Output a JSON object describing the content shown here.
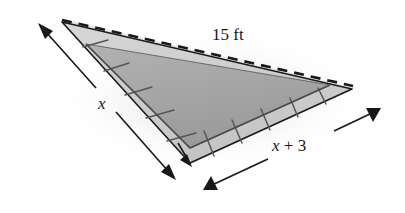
{
  "figure": {
    "labels": {
      "hypotenuse": "15 ft",
      "left_leg": "x",
      "bottom_leg_var": "x",
      "bottom_leg_op": " + ",
      "bottom_leg_const": "3",
      "bottom_leg": "x + 3"
    },
    "colors": {
      "background": "#ffffff",
      "outline": "#1a1a1c",
      "inner_fill": "#a9a9a9",
      "tile_fill": "#cfcfcf",
      "tile_fill_alt": "#c6c6c6",
      "tile_edge": "#6e6e70",
      "shadow": "#d8d8d8",
      "dimension_line": "#1a1a1c"
    },
    "geometry": {
      "apex_top_left": [
        60,
        18
      ],
      "vertex_bottom": [
        190,
        165
      ],
      "vertex_right": [
        356,
        88
      ],
      "tiles_left_edge": 5,
      "tiles_bottom_edge": 6
    }
  }
}
